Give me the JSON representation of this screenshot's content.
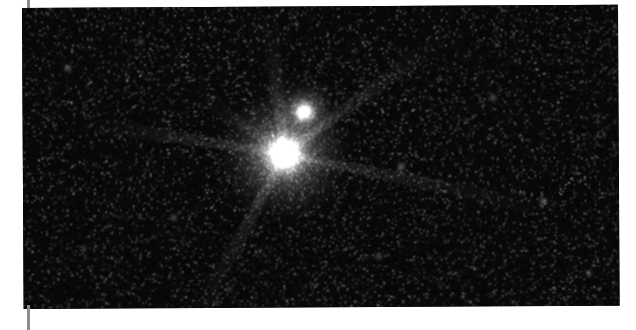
{
  "view": {
    "background_color": "#ffffff",
    "frame_color": "#000000",
    "tick_color": "#8d8d8d",
    "width": 636,
    "height": 330
  },
  "frame": {
    "left": 22,
    "top": 8,
    "width": 596,
    "height": 301,
    "rotation_deg": -0.32,
    "label": "astronomical-field-frame"
  },
  "ticks": [
    {
      "name": "crop-tick-top",
      "x": 27,
      "y": 0,
      "w": 3,
      "h": 11
    },
    {
      "name": "crop-tick-bottom",
      "x": 27,
      "y": 305,
      "w": 3,
      "h": 25
    }
  ],
  "chart_data": {
    "type": "scatter",
    "title": "",
    "subtitle": "",
    "xlabel": "",
    "ylabel": "",
    "grid": false,
    "legend": "none",
    "background": "#000000",
    "colormap": "grayscale",
    "xlim": [
      0,
      596
    ],
    "ylim": [
      0,
      301
    ],
    "sources": [
      {
        "name": "primary-star",
        "x": 261,
        "y": 147,
        "core_radius": 19,
        "halo_radius": 62,
        "peak_brightness": 1.0,
        "label": "bright primary point source"
      },
      {
        "name": "secondary-star",
        "x": 281,
        "y": 105,
        "core_radius": 9,
        "halo_radius": 30,
        "peak_brightness": 0.82,
        "label": "fainter companion point source"
      }
    ],
    "diffraction_spikes": [
      {
        "name": "spike-up",
        "angle_deg": -96,
        "length": 150,
        "width": 13,
        "intensity": 0.4
      },
      {
        "name": "spike-upper-right",
        "angle_deg": -36,
        "length": 215,
        "width": 13,
        "intensity": 0.38
      },
      {
        "name": "spike-right",
        "angle_deg": 12,
        "length": 290,
        "width": 12,
        "intensity": 0.26
      },
      {
        "name": "spike-lower-left",
        "angle_deg": 118,
        "length": 205,
        "width": 13,
        "intensity": 0.34
      },
      {
        "name": "spike-left",
        "angle_deg": 189,
        "length": 225,
        "width": 12,
        "intensity": 0.3
      },
      {
        "name": "spike-upper-left",
        "angle_deg": 215,
        "length": 120,
        "width": 11,
        "intensity": 0.2
      }
    ],
    "background_noise": {
      "type": "poisson-speckle",
      "density_per_kpx": 42,
      "mean_level": 0.045,
      "max_level": 0.35
    },
    "field_stars": [
      {
        "x": 45,
        "y": 60,
        "brightness": 0.18,
        "size": 2.4
      },
      {
        "x": 118,
        "y": 34,
        "brightness": 0.14,
        "size": 2.0
      },
      {
        "x": 150,
        "y": 210,
        "brightness": 0.16,
        "size": 2.2
      },
      {
        "x": 355,
        "y": 250,
        "brightness": 0.15,
        "size": 2.1
      },
      {
        "x": 470,
        "y": 92,
        "brightness": 0.17,
        "size": 2.3
      },
      {
        "x": 520,
        "y": 196,
        "brightness": 0.19,
        "size": 2.5
      },
      {
        "x": 565,
        "y": 268,
        "brightness": 0.13,
        "size": 2.0
      },
      {
        "x": 205,
        "y": 282,
        "brightness": 0.12,
        "size": 1.9
      },
      {
        "x": 378,
        "y": 160,
        "brightness": 0.2,
        "size": 2.4
      },
      {
        "x": 60,
        "y": 240,
        "brightness": 0.11,
        "size": 1.8
      }
    ]
  }
}
